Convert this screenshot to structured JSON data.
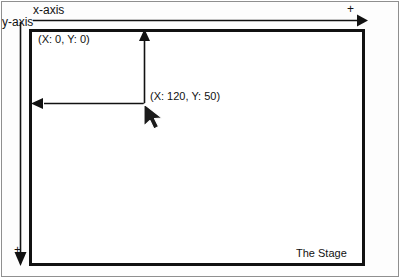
{
  "figure": {
    "width": 403,
    "height": 280,
    "background_color": "#ffffff",
    "line_color": "#111111",
    "frame_color": "#8f8f8f"
  },
  "axes": {
    "x_axis_label": "x-axis",
    "y_axis_label": "y-axis",
    "x_axis_positive_marker": "+",
    "y_axis_positive_marker": "+",
    "x_axis_direction": "right",
    "y_axis_direction": "down"
  },
  "stage": {
    "label": "The Stage",
    "origin_label": "(X: 0, Y: 0)",
    "point_label": "(X: 120, Y: 50)"
  },
  "measurement": {
    "horizontal_arrow_meaning": "X distance from origin to point",
    "vertical_arrow_meaning": "Y distance from point up to origin line",
    "x_value": 120,
    "y_value": 50
  },
  "cursor": {
    "icon": "arrow-pointer-icon",
    "x": 145,
    "y": 108
  },
  "icons": {
    "x_axis_arrowhead": "arrow-right-icon",
    "y_axis_arrowhead": "arrow-down-icon",
    "measure_left_arrowhead": "arrow-left-icon",
    "measure_up_arrowhead": "arrow-up-icon"
  }
}
